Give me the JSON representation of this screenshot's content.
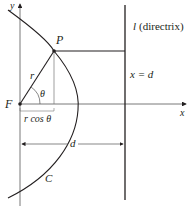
{
  "labels": {
    "y_axis": "y",
    "x_axis": "x",
    "focus": "F",
    "point": "P",
    "radius": "r",
    "angle": "θ",
    "projection": "r cos θ",
    "distance": "d",
    "curve": "C",
    "directrix_letter": "l",
    "directrix_text": "(directrix)",
    "directrix_equation": "x = d"
  },
  "colors": {
    "line": "#231f20",
    "axis": "#555555",
    "background": "#ffffff"
  }
}
